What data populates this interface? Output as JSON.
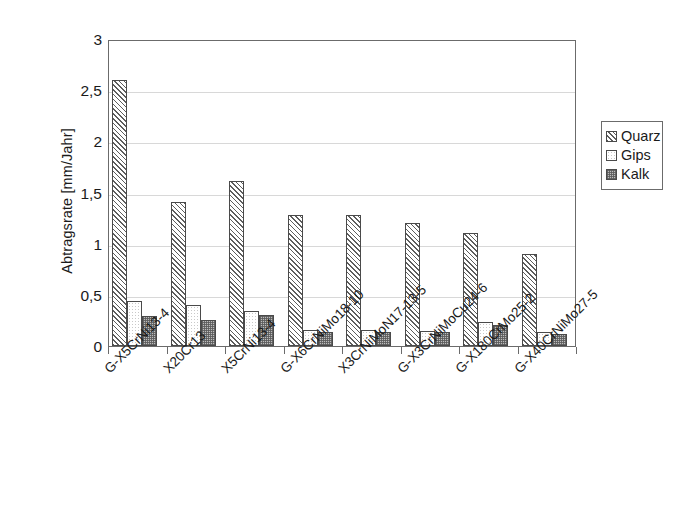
{
  "chart_data": {
    "type": "bar",
    "title": "",
    "xlabel": "",
    "ylabel": "Abtragsrate [mm/Jahr]",
    "ylim": [
      0,
      3
    ],
    "ytick_labels": [
      "0",
      "0,5",
      "1",
      "1,5",
      "2",
      "2,5",
      "3"
    ],
    "ytick_values": [
      0,
      0.5,
      1,
      1.5,
      2,
      2.5,
      3
    ],
    "grid": "horizontal",
    "legend_position": "right",
    "categories": [
      "G-X5CrNi13-4",
      "X20Cr13",
      "X5CrNi13-4",
      "G-X6CrNiMo18-10",
      "X3CrNiMoN17-13-5",
      "G-X3CrNiMoCu24-6",
      "G-X180CrMo25-2",
      "G-X40CrNiMo27-5"
    ],
    "series": [
      {
        "name": "Quarz",
        "pattern": "diagonal-hatch",
        "values": [
          2.6,
          1.41,
          1.61,
          1.28,
          1.28,
          1.2,
          1.1,
          0.9
        ]
      },
      {
        "name": "Gips",
        "pattern": "white-speckle",
        "values": [
          0.44,
          0.4,
          0.34,
          0.16,
          0.16,
          0.15,
          0.23,
          0.14
        ]
      },
      {
        "name": "Kalk",
        "pattern": "dense-dot-gray",
        "values": [
          0.29,
          0.25,
          0.3,
          0.14,
          0.14,
          0.14,
          0.21,
          0.12
        ]
      }
    ]
  },
  "colors": {
    "axis": "#6b6b6b",
    "gridline": "#d8d8d8",
    "bar_border": "#4a4a4a",
    "quarz_hatch": "#5d5d5d",
    "gips_fill": "#ffffff",
    "kalk_fill": "#bdbdbd",
    "text": "#1a1a1a",
    "background": "#ffffff"
  }
}
